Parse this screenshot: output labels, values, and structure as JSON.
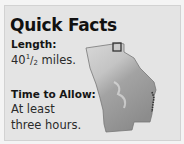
{
  "panel": {
    "title": "Quick Facts",
    "length": {
      "label": "Length:",
      "whole": "40",
      "fraction_num": "1",
      "fraction_sep": "/",
      "fraction_den": "2",
      "unit": " miles."
    },
    "time": {
      "label": "Time to Allow:",
      "value": "At least three hours."
    },
    "map": {
      "region": "Georgia",
      "marker": "trail-location-square"
    }
  },
  "colors": {
    "background": "#e4e4e4",
    "text": "#111111",
    "map_fill_dark": "#8a8a8a",
    "map_fill_light": "#d6d6d6",
    "marker": "#333333"
  }
}
